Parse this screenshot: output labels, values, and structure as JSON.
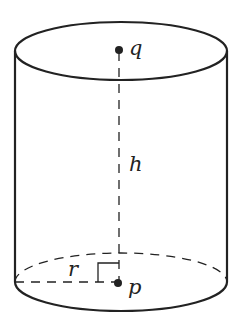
{
  "diagram": {
    "labels": {
      "top_center": "q",
      "bottom_center": "p",
      "height": "h",
      "radius": "r"
    },
    "colors": {
      "stroke": "#222222",
      "background": "#ffffff"
    }
  }
}
